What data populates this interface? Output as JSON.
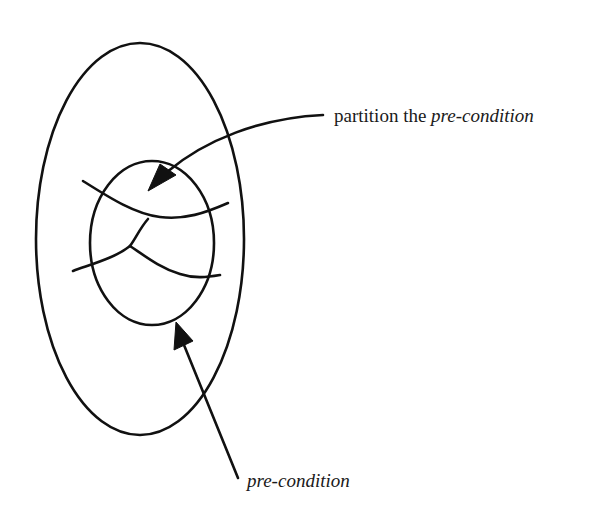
{
  "diagram": {
    "type": "set-partition-diagram",
    "colors": {
      "background": "#ffffff",
      "ink": "#111111"
    },
    "shapes": {
      "outer_ellipse": {
        "cx": 140,
        "cy": 239,
        "rx": 104,
        "ry": 196
      },
      "inner_ellipse": {
        "cx": 152,
        "cy": 243,
        "rx": 62,
        "ry": 82
      }
    },
    "annotations": [
      {
        "id": "partition",
        "text_plain": "partition the ",
        "text_italic": "pre-condition",
        "arrow_target": "inner-ellipse-top-edge"
      },
      {
        "id": "precondition",
        "text_plain": "",
        "text_italic": "pre-condition",
        "arrow_target": "inner-ellipse-bottom-edge"
      }
    ]
  }
}
